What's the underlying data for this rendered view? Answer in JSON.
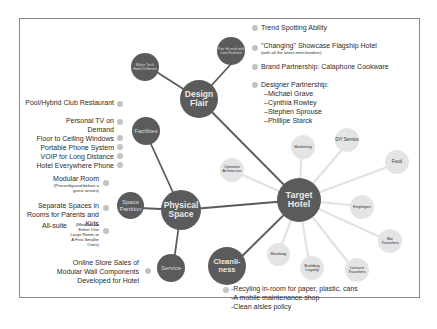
{
  "diagram": {
    "central_node": "Target Hotel",
    "main_nodes": {
      "design_flair": "Design Flair",
      "physical_space": "Physical Space",
      "cleanliness": "Cleanli-ness"
    },
    "design_flair": {
      "sub_nodes": [
        "Make Tech Hotel Different",
        "Pair Hi-end with Low Fashion"
      ],
      "bullets": [
        {
          "text": "Trend Spotting Ability"
        },
        {
          "text": "\"Changing\" Showcase Flagship Hotel",
          "note": "(with all the latest merchandise)"
        },
        {
          "text": "Brand Partnership: Calaphone Cookware"
        },
        {
          "text": "Designer Partnership:",
          "items": [
            "–Michael Grave",
            "–Cynthia Rowley",
            "–Stephen Sprouse",
            "–Phillipe Starck"
          ]
        }
      ]
    },
    "physical_space": {
      "facilities": {
        "label": "Facilities",
        "items": [
          "Pool/Hybrid Club Restaurant",
          "Personal TV on Demand",
          "Floor to Ceiling Windows",
          "Portable Phone System",
          "VOIP for Long Distance",
          "Hotel Everywhere Phone"
        ]
      },
      "space_partition": {
        "label": "Space Partition",
        "items": [
          {
            "text": "Modular Room",
            "note": "(Preconfigured before a guest arrives)"
          },
          {
            "text": "Separate Spaces in Rooms for Parents and Kids"
          },
          {
            "text": "All-suite",
            "note": "(Modular for Either One Large Room or A Few Smaller Ones)"
          }
        ]
      },
      "service": {
        "label": "Service",
        "items": [
          "Online Store Sales of Modular Wall Components Developed for Hotel"
        ]
      }
    },
    "target_hotel_satellites": [
      "Operation Architecture",
      "Marketing",
      "DIY Service",
      "Food",
      "Employee",
      "Biz Travelers",
      "Leisure Travelers",
      "Building Loyalty",
      "Booking"
    ],
    "cleanliness": {
      "items": [
        "-Recyling in-room for paper, plastic, cans",
        "-A mobile maintenance shop",
        "-Clean aisles policy"
      ]
    }
  },
  "colors": {
    "dark_node": "#5b5b5b",
    "light_node": "#e4e4e4",
    "bullet": "#c3c3c3",
    "dark_line": "#5b5b5b",
    "light_line": "#e4e4e4"
  }
}
